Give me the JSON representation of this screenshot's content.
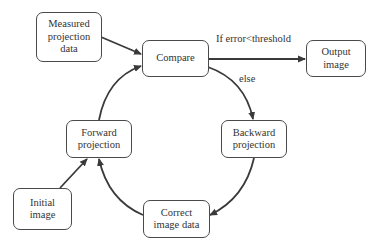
{
  "diagram": {
    "type": "flowchart",
    "title": "",
    "nodes": [
      {
        "id": "measured",
        "label": "Measured\nprojection\ndata"
      },
      {
        "id": "compare",
        "label": "Compare"
      },
      {
        "id": "output",
        "label": "Output\nimage"
      },
      {
        "id": "backward",
        "label": "Backward\nprojection"
      },
      {
        "id": "correct",
        "label": "Correct\nimage data"
      },
      {
        "id": "forward",
        "label": "Forward\nprojection"
      },
      {
        "id": "initial",
        "label": "Initial\nimage"
      }
    ],
    "edges": [
      {
        "from": "measured",
        "to": "compare",
        "label": ""
      },
      {
        "from": "compare",
        "to": "output",
        "label": "If error<threshold"
      },
      {
        "from": "compare",
        "to": "backward",
        "label": "else"
      },
      {
        "from": "backward",
        "to": "correct",
        "label": ""
      },
      {
        "from": "correct",
        "to": "forward",
        "label": ""
      },
      {
        "from": "initial",
        "to": "forward",
        "label": ""
      },
      {
        "from": "forward",
        "to": "compare",
        "label": ""
      }
    ],
    "edge_labels": {
      "threshold": "If error<threshold",
      "else": "else"
    },
    "colors": {
      "stroke": "#4a4a4a",
      "text": "#333333",
      "background": "#ffffff"
    }
  }
}
